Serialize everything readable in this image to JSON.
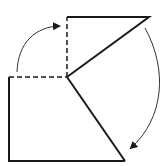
{
  "diagram": {
    "colors": {
      "stroke": "#1a1a1a",
      "arrow": "#333333",
      "background": "#ffffff"
    },
    "shapes": {
      "solid_outline": [
        [
          67,
          17
        ],
        [
          149,
          17
        ],
        [
          67,
          77
        ],
        [
          125,
          161
        ],
        [
          9,
          161
        ],
        [
          9,
          77
        ]
      ],
      "dashed_edges": [
        [
          [
            9,
            77
          ],
          [
            67,
            77
          ]
        ],
        [
          [
            67,
            77
          ],
          [
            67,
            17
          ]
        ]
      ]
    },
    "arrows": [
      {
        "name": "arrow-left-up",
        "path": "M17,72 C18,40 38,26 61,26",
        "head": [
          61,
          26
        ]
      },
      {
        "name": "arrow-right-down",
        "path": "M145,28 C168,70 165,120 130,149",
        "head": [
          130,
          149
        ]
      }
    ]
  }
}
